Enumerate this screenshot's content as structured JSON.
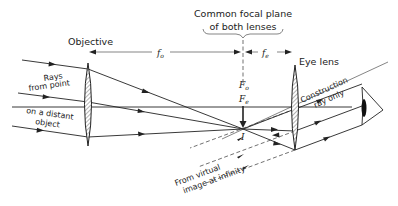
{
  "diagram": {
    "labels": {
      "objective": "Objective",
      "eye_lens": "Eye lens",
      "focal_plane_line1": "Common focal plane",
      "focal_plane_line2": "of both lenses",
      "rays_line1": "Rays",
      "rays_line2": "from point",
      "rays_line3": "on a distant",
      "rays_line4": "object",
      "construction_line1": "Construction",
      "construction_line2": "ray only",
      "virtual_line1": "From virtual",
      "virtual_line2": "image at infinity"
    },
    "symbols": {
      "f_o": "f",
      "f_o_sub": "o",
      "f_e": "f",
      "f_e_sub": "e",
      "F_o": "F",
      "F_o_sub": "o",
      "F_e": "F",
      "F_e_sub": "e",
      "image": "I"
    },
    "elements": [
      {
        "name": "objective-lens",
        "type": "converging lens",
        "x": 88
      },
      {
        "name": "eye-lens",
        "type": "converging lens",
        "x": 295
      },
      {
        "name": "focal-plane",
        "type": "dashed line",
        "x": 243
      },
      {
        "name": "image-point",
        "label": "I",
        "x": 243,
        "y": 129
      },
      {
        "name": "eye",
        "x": 370
      }
    ],
    "colors": {
      "ink": "#222222",
      "background": "#ffffff"
    }
  }
}
